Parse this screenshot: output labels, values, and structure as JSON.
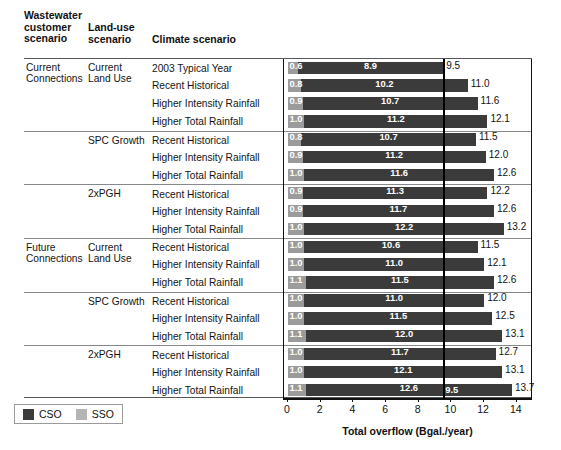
{
  "header": {
    "col_wastewater": "Wastewater customer scenario",
    "col_wastewater_l1": "Wastewater",
    "col_wastewater_l2": "customer",
    "col_wastewater_l3": "scenario",
    "col_landuse_l1": "Land-use",
    "col_landuse_l2": "scenario",
    "col_climate": "Climate scenario"
  },
  "legend": {
    "cso_label": "CSO",
    "sso_label": "SSO",
    "cso_color": "#3b3b3b",
    "sso_color": "#b4b4b4"
  },
  "axis": {
    "title": "Total overflow (Bgal./year)",
    "ticks": [
      "0",
      "2",
      "4",
      "6",
      "8",
      "10",
      "12",
      "14"
    ],
    "min": 0,
    "max": 14.5,
    "reference_line_value": "9.5"
  },
  "chart_data": {
    "type": "bar",
    "orientation": "horizontal",
    "stacked": true,
    "title": "",
    "xlabel": "Total overflow (Bgal./year)",
    "ylabel": "",
    "xlim": [
      0,
      14.5
    ],
    "xticks": [
      0,
      2,
      4,
      6,
      8,
      10,
      12,
      14
    ],
    "grid": false,
    "legend_position": "bottom-left",
    "annotations": [
      {
        "type": "vertical-reference-line",
        "value": 9.5,
        "label": "9.5"
      }
    ],
    "series": [
      {
        "name": "SSO",
        "color": "#9b9b9b"
      },
      {
        "name": "CSO",
        "color": "#3b3b3b"
      }
    ],
    "group_columns": [
      "Wastewater customer scenario",
      "Land-use scenario",
      "Climate scenario"
    ],
    "rows": [
      {
        "wastewater": "Current Connections",
        "wastewater_l1": "Current",
        "wastewater_l2": "Connections",
        "landuse": "Current Land Use",
        "landuse_l1": "Current",
        "landuse_l2": "Land Use",
        "climate": "2003 Typical Year",
        "sso": 0.6,
        "cso": 8.9,
        "total": 9.5,
        "sso_label": "0.6",
        "cso_label": "8.9",
        "total_label": "9.5",
        "new_ww_group": true,
        "new_lu_group": true
      },
      {
        "wastewater": "",
        "landuse": "",
        "climate": "Recent Historical",
        "sso": 0.8,
        "cso": 10.2,
        "total": 11.0,
        "sso_label": "0.8",
        "cso_label": "10.2",
        "total_label": "11.0",
        "new_ww_group": false,
        "new_lu_group": false
      },
      {
        "wastewater": "",
        "landuse": "",
        "climate": "Higher Intensity Rainfall",
        "sso": 0.9,
        "cso": 10.7,
        "total": 11.6,
        "sso_label": "0.9",
        "cso_label": "10.7",
        "total_label": "11.6",
        "new_ww_group": false,
        "new_lu_group": false
      },
      {
        "wastewater": "",
        "landuse": "",
        "climate": "Higher Total Rainfall",
        "sso": 1.0,
        "cso": 11.2,
        "total": 12.1,
        "sso_label": "1.0",
        "cso_label": "11.2",
        "total_label": "12.1",
        "new_ww_group": false,
        "new_lu_group": false
      },
      {
        "wastewater": "",
        "landuse": "SPC Growth",
        "landuse_l1": "SPC Growth",
        "landuse_l2": "",
        "climate": "Recent Historical",
        "sso": 0.8,
        "cso": 10.7,
        "total": 11.5,
        "sso_label": "0.8",
        "cso_label": "10.7",
        "total_label": "11.5",
        "new_ww_group": false,
        "new_lu_group": true
      },
      {
        "wastewater": "",
        "landuse": "",
        "climate": "Higher Intensity Rainfall",
        "sso": 0.9,
        "cso": 11.2,
        "total": 12.0,
        "sso_label": "0.9",
        "cso_label": "11.2",
        "total_label": "12.0",
        "new_ww_group": false,
        "new_lu_group": false
      },
      {
        "wastewater": "",
        "landuse": "",
        "climate": "Higher Total Rainfall",
        "sso": 1.0,
        "cso": 11.6,
        "total": 12.6,
        "sso_label": "1.0",
        "cso_label": "11.6",
        "total_label": "12.6",
        "new_ww_group": false,
        "new_lu_group": false
      },
      {
        "wastewater": "",
        "landuse": "2xPGH",
        "landuse_l1": "2xPGH",
        "landuse_l2": "",
        "climate": "Recent Historical",
        "sso": 0.9,
        "cso": 11.3,
        "total": 12.2,
        "sso_label": "0.9",
        "cso_label": "11.3",
        "total_label": "12.2",
        "new_ww_group": false,
        "new_lu_group": true
      },
      {
        "wastewater": "",
        "landuse": "",
        "climate": "Higher Intensity Rainfall",
        "sso": 0.9,
        "cso": 11.7,
        "total": 12.6,
        "sso_label": "0.9",
        "cso_label": "11.7",
        "total_label": "12.6",
        "new_ww_group": false,
        "new_lu_group": false
      },
      {
        "wastewater": "",
        "landuse": "",
        "climate": "Higher Total Rainfall",
        "sso": 1.0,
        "cso": 12.2,
        "total": 13.2,
        "sso_label": "1.0",
        "cso_label": "12.2",
        "total_label": "13.2",
        "new_ww_group": false,
        "new_lu_group": false
      },
      {
        "wastewater": "Future Connections",
        "wastewater_l1": "Future",
        "wastewater_l2": "Connections",
        "landuse": "Current Land Use",
        "landuse_l1": "Current",
        "landuse_l2": "Land Use",
        "climate": "Recent Historical",
        "sso": 1.0,
        "cso": 10.6,
        "total": 11.5,
        "sso_label": "1.0",
        "cso_label": "10.6",
        "total_label": "11.5",
        "new_ww_group": true,
        "new_lu_group": true
      },
      {
        "wastewater": "",
        "landuse": "",
        "climate": "Higher Intensity Rainfall",
        "sso": 1.0,
        "cso": 11.0,
        "total": 12.1,
        "sso_label": "1.0",
        "cso_label": "11.0",
        "total_label": "12.1",
        "new_ww_group": false,
        "new_lu_group": false
      },
      {
        "wastewater": "",
        "landuse": "",
        "climate": "Higher Total Rainfall",
        "sso": 1.1,
        "cso": 11.5,
        "total": 12.6,
        "sso_label": "1.1",
        "cso_label": "11.5",
        "total_label": "12.6",
        "new_ww_group": false,
        "new_lu_group": false
      },
      {
        "wastewater": "",
        "landuse": "SPC Growth",
        "landuse_l1": "SPC Growth",
        "landuse_l2": "",
        "climate": "Recent Historical",
        "sso": 1.0,
        "cso": 11.0,
        "total": 12.0,
        "sso_label": "1.0",
        "cso_label": "11.0",
        "total_label": "12.0",
        "new_ww_group": false,
        "new_lu_group": true
      },
      {
        "wastewater": "",
        "landuse": "",
        "climate": "Higher Intensity Rainfall",
        "sso": 1.0,
        "cso": 11.5,
        "total": 12.5,
        "sso_label": "1.0",
        "cso_label": "11.5",
        "total_label": "12.5",
        "new_ww_group": false,
        "new_lu_group": false
      },
      {
        "wastewater": "",
        "landuse": "",
        "climate": "Higher Total Rainfall",
        "sso": 1.1,
        "cso": 12.0,
        "total": 13.1,
        "sso_label": "1.1",
        "cso_label": "12.0",
        "total_label": "13.1",
        "new_ww_group": false,
        "new_lu_group": false
      },
      {
        "wastewater": "",
        "landuse": "2xPGH",
        "landuse_l1": "2xPGH",
        "landuse_l2": "",
        "climate": "Recent Historical",
        "sso": 1.0,
        "cso": 11.7,
        "total": 12.7,
        "sso_label": "1.0",
        "cso_label": "11.7",
        "total_label": "12.7",
        "new_ww_group": false,
        "new_lu_group": true
      },
      {
        "wastewater": "",
        "landuse": "",
        "climate": "Higher Intensity Rainfall",
        "sso": 1.0,
        "cso": 12.1,
        "total": 13.1,
        "sso_label": "1.0",
        "cso_label": "12.1",
        "total_label": "13.1",
        "new_ww_group": false,
        "new_lu_group": false
      },
      {
        "wastewater": "",
        "landuse": "",
        "climate": "Higher Total Rainfall",
        "sso": 1.1,
        "cso": 12.6,
        "total": 13.7,
        "sso_label": "1.1",
        "cso_label": "12.6",
        "total_label": "13.7",
        "new_ww_group": false,
        "new_lu_group": false
      }
    ]
  }
}
